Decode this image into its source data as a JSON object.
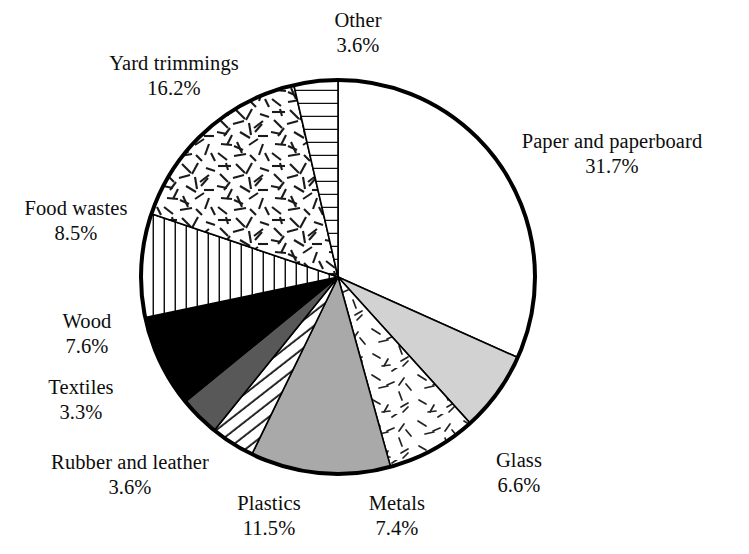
{
  "chart_data": {
    "type": "pie",
    "title": "",
    "subtitle": "",
    "xlabel": "",
    "ylabel": "",
    "legend_position": "none",
    "grid": false,
    "units": "percent",
    "total": 100.0,
    "start_angle_deg": 0,
    "direction": "clockwise",
    "categories": [
      "Paper and paperboard",
      "Glass",
      "Metals",
      "Plastics",
      "Rubber and leather",
      "Textiles",
      "Wood",
      "Food wastes",
      "Yard trimmings",
      "Other"
    ],
    "values": [
      31.7,
      6.6,
      7.4,
      11.5,
      3.6,
      3.3,
      7.6,
      8.5,
      16.2,
      3.6
    ],
    "slices": [
      {
        "label": "Paper and paperboard",
        "value": 31.7,
        "value_text": "31.7%",
        "fill": "#ffffff",
        "pattern": "none",
        "label_x": 612,
        "label_y": 129
      },
      {
        "label": "Glass",
        "value": 6.6,
        "value_text": "6.6%",
        "fill": "#d2d2d2",
        "pattern": "none",
        "label_x": 519,
        "label_y": 448
      },
      {
        "label": "Metals",
        "value": 7.4,
        "value_text": "7.4%",
        "fill": "#ffffff",
        "pattern": "speckle-dashes",
        "label_x": 397,
        "label_y": 491
      },
      {
        "label": "Plastics",
        "value": 11.5,
        "value_text": "11.5%",
        "fill": "#a9a9a9",
        "pattern": "none",
        "label_x": 269,
        "label_y": 491
      },
      {
        "label": "Rubber and leather",
        "value": 3.6,
        "value_text": "3.6%",
        "fill": "#ffffff",
        "pattern": "angled-lines",
        "label_x": 130,
        "label_y": 450
      },
      {
        "label": "Textiles",
        "value": 3.3,
        "value_text": "3.3%",
        "fill": "#585858",
        "pattern": "none",
        "label_x": 81,
        "label_y": 375
      },
      {
        "label": "Wood",
        "value": 7.6,
        "value_text": "7.6%",
        "fill": "#000000",
        "pattern": "none",
        "label_x": 87,
        "label_y": 309
      },
      {
        "label": "Food wastes",
        "value": 8.5,
        "value_text": "8.5%",
        "fill": "#ffffff",
        "pattern": "vertical-lines",
        "label_x": 76,
        "label_y": 196
      },
      {
        "label": "Yard trimmings",
        "value": 16.2,
        "value_text": "16.2%",
        "fill": "#ffffff",
        "pattern": "straw-dashes",
        "label_x": 174,
        "label_y": 51
      },
      {
        "label": "Other",
        "value": 3.6,
        "value_text": "3.6%",
        "fill": "#ffffff",
        "pattern": "horizontal-lines",
        "label_x": 358,
        "label_y": 8
      }
    ],
    "geometry": {
      "center_x": 338,
      "center_y": 277,
      "radius": 197,
      "outline_color": "#000000",
      "outline_width": 4
    }
  }
}
